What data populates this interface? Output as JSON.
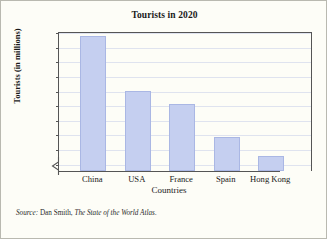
{
  "chart_data": {
    "type": "bar",
    "title": "Tourists in 2020",
    "xlabel": "Countries",
    "ylabel": "Tourists (in millions)",
    "categories": [
      "China",
      "USA",
      "France",
      "Spain",
      "Hong Kong"
    ],
    "values": [
      137,
      100,
      91,
      68,
      55
    ],
    "yticks": [
      50,
      60,
      70,
      80,
      90,
      100,
      110,
      120,
      130,
      140
    ],
    "ylim": [
      45,
      140
    ],
    "axis_break": true,
    "grid": true,
    "legend": "none",
    "bar_color": "#c5cff0",
    "bar_border_color": "#aab7e4",
    "axis_color": "#555555",
    "grid_color": "#dfe3ef"
  },
  "source": {
    "prefix": "Source:",
    "author": "Dan Smith,",
    "book": "The State of the World Atlas."
  }
}
